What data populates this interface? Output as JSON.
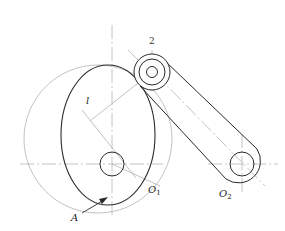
{
  "diagram": {
    "colors": {
      "outline": "#2a2a2a",
      "centerline": "#b5b5b5",
      "construction": "#a8a8a8",
      "background": "#ffffff"
    },
    "labels": {
      "follower_number": "2",
      "radius": "l",
      "cam_center": "O",
      "cam_center_sub": "1",
      "pivot_center": "O",
      "pivot_center_sub": "2",
      "contact_point": "A"
    },
    "components": [
      {
        "id": "cam",
        "shape": "ellipse"
      },
      {
        "id": "cam-hub",
        "shape": "circle"
      },
      {
        "id": "base-circle",
        "shape": "circle"
      },
      {
        "id": "roller",
        "shape": "circle"
      },
      {
        "id": "follower-link",
        "shape": "slot-link"
      },
      {
        "id": "pivot-hub",
        "shape": "circle"
      }
    ]
  }
}
